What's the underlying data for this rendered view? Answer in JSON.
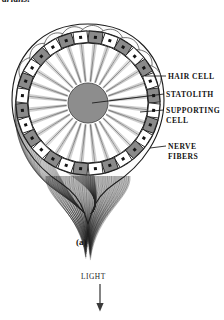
{
  "page": {
    "top_caption": "arians.",
    "background_color": "#ffffff"
  },
  "figure": {
    "panel_caption": "(a)",
    "title_semantic": "statocyst-cross-section",
    "colors": {
      "outline": "#1a1a1a",
      "supporting_cell_fill": "#8a8a8a",
      "hair_cell_fill": "#ffffff",
      "statolith_fill": "#8d8d8d",
      "nucleus_fill": "#141414",
      "capsule_fill": "#fbfbfb",
      "nerve_fiber": "#2b2b2b"
    },
    "geometry": {
      "center_x": 88,
      "center_y": 103,
      "ring_outer_radius": 72,
      "ring_inner_radius": 60,
      "statolith_radius": 20,
      "cell_count": 28,
      "cilia_count": 28
    },
    "labels": [
      {
        "id": "hair-cell",
        "line1": "HAIR  CELL",
        "line2": ""
      },
      {
        "id": "statolith",
        "line1": "STATOLITH",
        "line2": ""
      },
      {
        "id": "supporting",
        "line1": "SUPPORTING",
        "line2": "CELL"
      },
      {
        "id": "nerve",
        "line1": "NERVE",
        "line2": "FIBERS"
      }
    ]
  },
  "light": {
    "label": "LIGHT",
    "arrow_direction": "down"
  }
}
